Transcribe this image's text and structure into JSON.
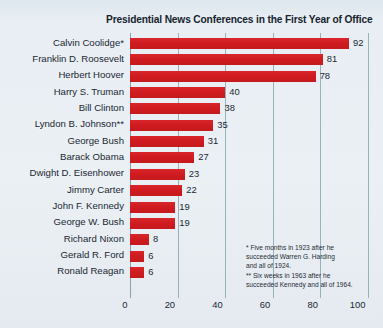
{
  "chart_data": {
    "type": "bar",
    "orientation": "horizontal",
    "title": "Presidential News Conferences in the First Year of Office",
    "xlabel": "",
    "ylabel": "",
    "xlim": [
      0,
      100
    ],
    "xticks": [
      0,
      20,
      40,
      60,
      80,
      100
    ],
    "xtick_labels": [
      "0",
      "20",
      "40",
      "60",
      "80",
      "100"
    ],
    "grid": "vertical",
    "legend": "none",
    "bar_color": "#d51f22",
    "background_color": "#e9eff3",
    "categories": [
      "Calvin Coolidge*",
      "Franklin D. Roosevelt",
      "Herbert Hoover",
      "Harry S. Truman",
      "Bill Clinton",
      "Lyndon B. Johnson**",
      "George Bush",
      "Barack Obama",
      "Dwight D. Eisenhower",
      "Jimmy Carter",
      "John F. Kennedy",
      "George W. Bush",
      "Richard Nixon",
      "Gerald R. Ford",
      "Ronald Reagan"
    ],
    "values": [
      92,
      81,
      78,
      40,
      38,
      35,
      31,
      27,
      23,
      22,
      19,
      19,
      8,
      6,
      6
    ],
    "value_labels": [
      "92",
      "81",
      "78",
      "40",
      "38",
      "35",
      "31",
      "27",
      "23",
      "22",
      "19",
      "19",
      "8",
      "6",
      "6"
    ],
    "annotations": [
      "* Five months in 1923 after he",
      "succeeded Warren G. Harding",
      "and all of 1924.",
      "** Six weeks in 1963 after he",
      "succeeded Kennedy and all of 1964."
    ]
  }
}
